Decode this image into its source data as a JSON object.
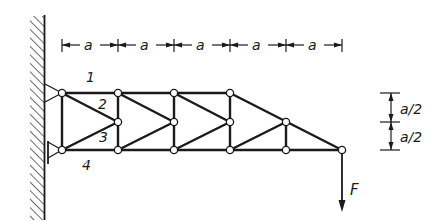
{
  "diagram": {
    "type": "cantilever-truss",
    "colors": {
      "ink": "#1a1a1a",
      "background": "#ffffff",
      "node_fill": "#ffffff"
    },
    "support": {
      "kind": "wall",
      "hatched": true
    },
    "member_labels": [
      {
        "id": "1",
        "text": "1"
      },
      {
        "id": "2",
        "text": "2"
      },
      {
        "id": "3",
        "text": "3"
      },
      {
        "id": "4",
        "text": "4"
      }
    ],
    "horizontal_dimensions": {
      "segments": [
        {
          "label": "a"
        },
        {
          "label": "a"
        },
        {
          "label": "a"
        },
        {
          "label": "a"
        },
        {
          "label": "a"
        }
      ]
    },
    "vertical_dimensions": {
      "segments": [
        {
          "label": "a/2"
        },
        {
          "label": "a/2"
        }
      ]
    },
    "load": {
      "label": "F",
      "direction": "down"
    }
  }
}
